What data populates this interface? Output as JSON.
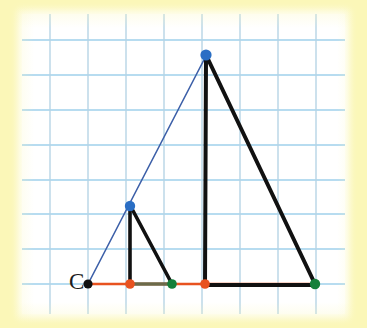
{
  "canvas": {
    "width": 367,
    "height": 328
  },
  "colors": {
    "page_border": "#fbf7b8",
    "paper": "#ffffff",
    "grid_line": "#96ccea",
    "grid_line_faint": "#bcd9e8",
    "figure_stroke": "#111111",
    "ray_stroke": "#3c5fa8",
    "baseline_stroke": "#e8521f",
    "segment_stroke": "#6b6a4a",
    "point_center": "#111111",
    "point_apex": "#2a6ec4",
    "point_foot": "#e8521f",
    "point_end": "#15803a"
  },
  "grid": {
    "visible": true,
    "origin_x": 50,
    "origin_y": 40,
    "spacing_x": 38,
    "spacing_y": 35,
    "columns": 8,
    "rows": 8
  },
  "labels": [
    {
      "id": "label-C",
      "text": "C",
      "x": 70,
      "y": 272
    }
  ],
  "figure": {
    "baseline": {
      "name": "baseline",
      "x1": 88,
      "y1": 284,
      "x2": 318,
      "y2": 284
    },
    "ray": {
      "name": "dilation-ray",
      "x1": 88,
      "y1": 284,
      "x2": 208,
      "y2": 53
    },
    "small_triangle": {
      "name": "pre-image-triangle",
      "apex": {
        "x": 130,
        "y": 206
      },
      "foot": {
        "x": 130,
        "y": 284
      },
      "end": {
        "x": 172,
        "y": 284
      }
    },
    "large_triangle": {
      "name": "image-triangle",
      "apex": {
        "x": 206,
        "y": 55
      },
      "foot": {
        "x": 205,
        "y": 284
      },
      "end": {
        "x": 315,
        "y": 284
      }
    },
    "inner_segment": {
      "name": "base-segment-small",
      "x1": 130,
      "y1": 284,
      "x2": 172,
      "y2": 284
    }
  },
  "points": [
    {
      "id": "point-C",
      "label": "C",
      "x": 88,
      "y": 284,
      "color": "#111111",
      "r": 4.6
    },
    {
      "id": "point-small-foot",
      "label": "",
      "x": 130,
      "y": 284,
      "color": "#e8521f",
      "r": 4.8
    },
    {
      "id": "point-small-apex",
      "label": "",
      "x": 130,
      "y": 206,
      "color": "#2a6ec4",
      "r": 5.2
    },
    {
      "id": "point-small-end",
      "label": "",
      "x": 172,
      "y": 284,
      "color": "#15803a",
      "r": 4.8
    },
    {
      "id": "point-large-foot",
      "label": "",
      "x": 205,
      "y": 284,
      "color": "#e8521f",
      "r": 4.8
    },
    {
      "id": "point-large-apex",
      "label": "",
      "x": 206,
      "y": 55,
      "color": "#2a6ec4",
      "r": 5.6
    },
    {
      "id": "point-large-end",
      "label": "",
      "x": 315,
      "y": 284,
      "color": "#15803a",
      "r": 5.2
    }
  ]
}
